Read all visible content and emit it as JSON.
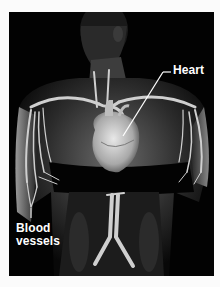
{
  "figure": {
    "labels": {
      "heart": "Heart",
      "blood_vessels_line1": "Blood",
      "blood_vessels_line2": "vessels"
    },
    "colors": {
      "background": "#fbfbfb",
      "panel": "#020202",
      "label_text": "#ffffff"
    }
  }
}
